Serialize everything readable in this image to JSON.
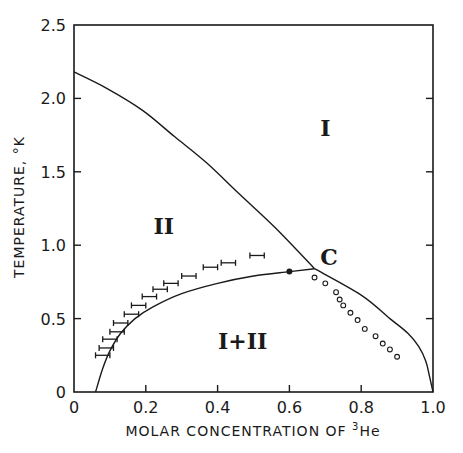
{
  "chart_data": {
    "type": "line",
    "title": "",
    "xlabel": "MOLAR CONCENTRATION OF",
    "xlabel_sup": "3",
    "xlabel_tail": "He",
    "ylabel": "TEMPERATURE, °K",
    "xlim": [
      0,
      1.0
    ],
    "ylim": [
      0,
      2.5
    ],
    "grid": false,
    "x_ticks": [
      "0",
      "0.2",
      "0.4",
      "0.6",
      "0.8",
      "1.0"
    ],
    "y_ticks": [
      "0",
      "0.5",
      "1.0",
      "1.5",
      "2.0",
      "2.5"
    ],
    "regions": [
      {
        "label": "I",
        "x": 0.7,
        "y": 1.8
      },
      {
        "label": "II",
        "x": 0.25,
        "y": 1.13
      },
      {
        "label": "I+II",
        "x": 0.47,
        "y": 0.35
      },
      {
        "label": "C",
        "x": 0.71,
        "y": 0.92
      }
    ],
    "series": [
      {
        "name": "lambda line",
        "x": [
          0.0,
          0.09,
          0.19,
          0.28,
          0.37,
          0.46,
          0.56,
          0.67
        ],
        "y": [
          2.18,
          2.07,
          1.92,
          1.74,
          1.56,
          1.35,
          1.12,
          0.84
        ]
      },
      {
        "name": "phase separation curve",
        "x": [
          0.06,
          0.08,
          0.1,
          0.13,
          0.17,
          0.22,
          0.3,
          0.4,
          0.5,
          0.6,
          0.67
        ],
        "y": [
          0.0,
          0.16,
          0.28,
          0.4,
          0.5,
          0.58,
          0.67,
          0.74,
          0.79,
          0.82,
          0.84
        ]
      },
      {
        "name": "upper branch to pure 3He",
        "x": [
          0.67,
          0.8,
          0.88,
          0.93,
          0.96,
          0.98,
          0.99,
          1.0
        ],
        "y": [
          0.84,
          0.66,
          0.5,
          0.4,
          0.31,
          0.21,
          0.11,
          0.0
        ]
      },
      {
        "name": "error-bar data",
        "x": [
          0.08,
          0.09,
          0.1,
          0.12,
          0.13,
          0.16,
          0.18,
          0.21,
          0.24,
          0.27,
          0.32,
          0.38,
          0.43,
          0.51
        ],
        "y": [
          0.25,
          0.3,
          0.36,
          0.41,
          0.47,
          0.53,
          0.59,
          0.65,
          0.7,
          0.74,
          0.79,
          0.85,
          0.88,
          0.93
        ],
        "error_halfwidth_x": 0.02
      },
      {
        "name": "filled point",
        "x": [
          0.6
        ],
        "y": [
          0.82
        ]
      },
      {
        "name": "open circles",
        "x": [
          0.67,
          0.7,
          0.73,
          0.74,
          0.75,
          0.77,
          0.79,
          0.81,
          0.84,
          0.86,
          0.88,
          0.9
        ],
        "y": [
          0.78,
          0.74,
          0.68,
          0.63,
          0.59,
          0.54,
          0.49,
          0.43,
          0.38,
          0.33,
          0.29,
          0.24
        ]
      }
    ]
  },
  "labels": {
    "region_I": "I",
    "region_II": "II",
    "region_I_II": "I+II",
    "critical_point": "C"
  }
}
